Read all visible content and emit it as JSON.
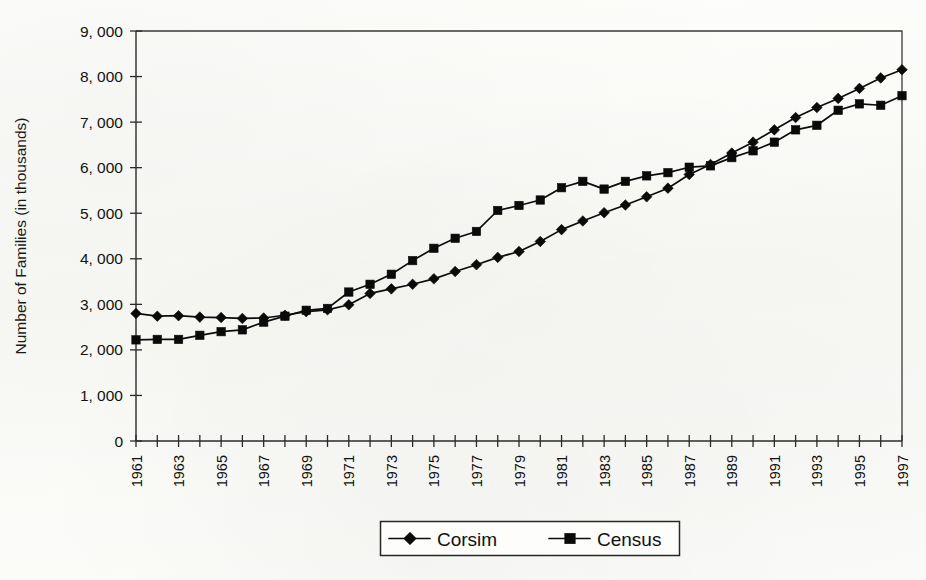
{
  "chart_data": {
    "type": "line",
    "title": "",
    "xlabel": "",
    "ylabel": "Number of Families (in thousands)",
    "ylim": [
      0,
      9000
    ],
    "ytick_step": 1000,
    "yticks": [
      0,
      1000,
      2000,
      3000,
      4000,
      5000,
      6000,
      7000,
      8000,
      9000
    ],
    "ytick_labels": [
      "0",
      "1, 000",
      "2, 000",
      "3, 000",
      "4, 000",
      "5, 000",
      "6, 000",
      "7, 000",
      "8, 000",
      "9, 000"
    ],
    "xlim": [
      1961,
      1997
    ],
    "x": [
      1961,
      1962,
      1963,
      1964,
      1965,
      1966,
      1967,
      1968,
      1969,
      1970,
      1971,
      1972,
      1973,
      1974,
      1975,
      1976,
      1977,
      1978,
      1979,
      1980,
      1981,
      1982,
      1983,
      1984,
      1985,
      1986,
      1987,
      1988,
      1989,
      1990,
      1991,
      1992,
      1993,
      1994,
      1995,
      1996,
      1997
    ],
    "xtick_labels": [
      "1961",
      "1963",
      "1965",
      "1967",
      "1969",
      "1971",
      "1973",
      "1975",
      "1977",
      "1979",
      "1981",
      "1983",
      "1985",
      "1987",
      "1989",
      "1991",
      "1993",
      "1995",
      "1997"
    ],
    "xtick_label_rotation": -90,
    "grid": false,
    "legend_position": "bottom-center",
    "series": [
      {
        "name": "Corsim",
        "marker": "diamond",
        "color": "#0a0a0a",
        "values": [
          2800,
          2740,
          2750,
          2720,
          2710,
          2690,
          2700,
          2760,
          2840,
          2880,
          2990,
          3240,
          3340,
          3440,
          3560,
          3720,
          3870,
          4030,
          4160,
          4380,
          4640,
          4830,
          5010,
          5180,
          5360,
          5550,
          5850,
          6070,
          6320,
          6560,
          6830,
          7100,
          7320,
          7520,
          7740,
          7970,
          8150
        ]
      },
      {
        "name": "Census",
        "marker": "square",
        "color": "#0a0a0a",
        "values": [
          2220,
          2230,
          2230,
          2320,
          2400,
          2440,
          2610,
          2740,
          2870,
          2910,
          3270,
          3440,
          3660,
          3960,
          4230,
          4450,
          4600,
          5060,
          5170,
          5290,
          5560,
          5700,
          5530,
          5700,
          5820,
          5890,
          6010,
          6040,
          6220,
          6370,
          6560,
          6830,
          6930,
          7260,
          7400,
          7370,
          7580
        ]
      }
    ]
  },
  "legend": {
    "entries": [
      {
        "label": "Corsim",
        "marker": "diamond"
      },
      {
        "label": "Census",
        "marker": "square"
      }
    ]
  }
}
